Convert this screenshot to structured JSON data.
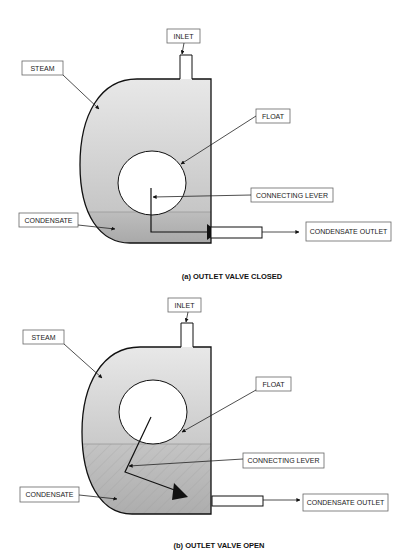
{
  "colors": {
    "steam_top": "#e6e6e6",
    "steam_bottom": "#c8c8c8",
    "condensate": "#b4b4b4",
    "outline": "#111111",
    "float_fill": "#ffffff",
    "label_border": "#666666"
  },
  "diagram_a": {
    "caption": "(a) OUTLET VALVE CLOSED",
    "labels": {
      "inlet": "INLET",
      "steam": "STEAM",
      "float": "FLOAT",
      "connecting_lever": "CONNECTING LEVER",
      "condensate": "CONDENSATE",
      "condensate_outlet": "CONDENSATE OUTLET"
    },
    "valve_state": "closed"
  },
  "diagram_b": {
    "caption": "(b) OUTLET VALVE OPEN",
    "labels": {
      "inlet": "INLET",
      "steam": "STEAM",
      "float": "FLOAT",
      "connecting_lever": "CONNECTING LEVER",
      "condensate": "CONDENSATE",
      "condensate_outlet": "CONDENSATE OUTLET"
    },
    "valve_state": "open"
  }
}
